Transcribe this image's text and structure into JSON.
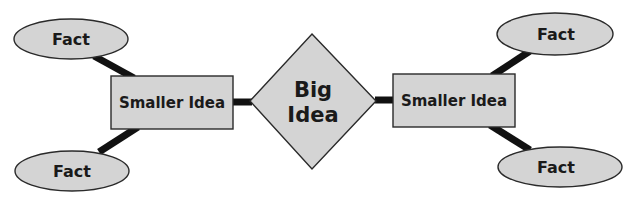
{
  "diagram": {
    "type": "concept-map",
    "colors": {
      "node_fill": "#d4d4d4",
      "node_stroke": "#2a2a2a",
      "link": "#111111",
      "text": "#1a1a1a",
      "background": "#ffffff"
    },
    "center": {
      "shape": "diamond",
      "line1": "Big",
      "line2": "Idea"
    },
    "left": {
      "idea": {
        "shape": "rectangle",
        "label": "Smaller Idea"
      },
      "facts": [
        {
          "shape": "ellipse",
          "label": "Fact"
        },
        {
          "shape": "ellipse",
          "label": "Fact"
        }
      ]
    },
    "right": {
      "idea": {
        "shape": "rectangle",
        "label": "Smaller Idea"
      },
      "facts": [
        {
          "shape": "ellipse",
          "label": "Fact"
        },
        {
          "shape": "ellipse",
          "label": "Fact"
        }
      ]
    },
    "edges": [
      {
        "from": "left.facts.0",
        "to": "left.idea"
      },
      {
        "from": "left.facts.1",
        "to": "left.idea"
      },
      {
        "from": "left.idea",
        "to": "center"
      },
      {
        "from": "center",
        "to": "right.idea"
      },
      {
        "from": "right.idea",
        "to": "right.facts.0"
      },
      {
        "from": "right.idea",
        "to": "right.facts.1"
      }
    ]
  }
}
